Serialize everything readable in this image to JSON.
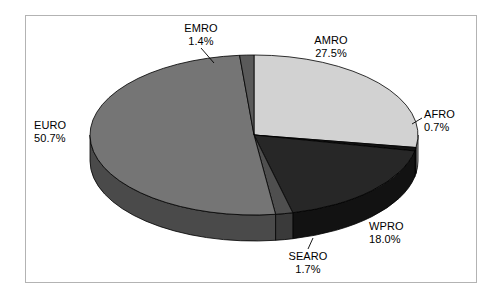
{
  "figure": {
    "background_color": "#ffffff",
    "frame_color": "#b3b3b3",
    "label_text_color": "#000000"
  },
  "chart_data": {
    "type": "pie",
    "title": "",
    "subtitle": "",
    "xlabel": "",
    "ylabel": "",
    "grid": false,
    "legend": "none",
    "label_format": "name + percent",
    "three_d": true,
    "start_angle_deg": -90,
    "direction": "clockwise",
    "categories": [
      "AMRO",
      "AFRO",
      "WPRO",
      "SEARO",
      "EURO",
      "EMRO"
    ],
    "values": [
      27.5,
      0.7,
      18.0,
      1.7,
      50.7,
      1.4
    ],
    "units": "%",
    "total": 100.0,
    "slices": [
      {
        "name": "AMRO",
        "value": 27.5,
        "percent_label": "27.5%",
        "color": "#d2d2d2",
        "side_color": "#a8a8a8",
        "label_position": "top-right"
      },
      {
        "name": "AFRO",
        "value": 0.7,
        "percent_label": "0.7%",
        "color": "#131313",
        "side_color": "#0d0d0d",
        "label_position": "right"
      },
      {
        "name": "WPRO",
        "value": 18.0,
        "percent_label": "18.0%",
        "color": "#272727",
        "side_color": "#121212",
        "label_position": "bottom-right"
      },
      {
        "name": "SEARO",
        "value": 1.7,
        "percent_label": "1.7%",
        "color": "#4f4f4f",
        "side_color": "#3a3a3a",
        "label_position": "bottom"
      },
      {
        "name": "EURO",
        "value": 50.7,
        "percent_label": "50.7%",
        "color": "#757575",
        "side_color": "#4a4a4a",
        "label_position": "left"
      },
      {
        "name": "EMRO",
        "value": 1.4,
        "percent_label": "1.4%",
        "color": "#5a5a5a",
        "side_color": "#434343",
        "label_position": "top"
      }
    ]
  },
  "labels": {
    "amro": {
      "name": "AMRO",
      "percent": "27.5%"
    },
    "afro": {
      "name": "AFRO",
      "percent": "0.7%"
    },
    "wpro": {
      "name": "WPRO",
      "percent": "18.0%"
    },
    "searo": {
      "name": "SEARO",
      "percent": "1.7%"
    },
    "euro": {
      "name": "EURO",
      "percent": "50.7%"
    },
    "emro": {
      "name": "EMRO",
      "percent": "1.4%"
    }
  }
}
